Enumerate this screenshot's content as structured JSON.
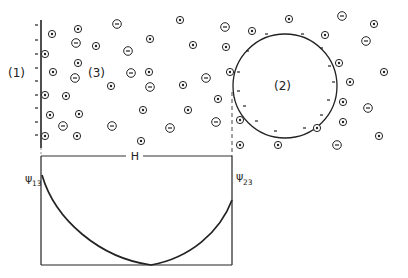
{
  "diagram": {
    "regions": {
      "surface1": "(1)",
      "medium3": "(3)",
      "particle2": "(2)"
    },
    "distance_label": "H",
    "potential_labels": {
      "left": {
        "symbol": "ψ",
        "sub": "13"
      },
      "right": {
        "symbol": "ψ",
        "sub": "23"
      }
    },
    "colors": {
      "ink": "#222222",
      "background": "#ffffff"
    },
    "ions": [
      {
        "x": 52,
        "y": 34,
        "sign": "+"
      },
      {
        "x": 78,
        "y": 29,
        "sign": "+"
      },
      {
        "x": 117,
        "y": 24,
        "sign": "-"
      },
      {
        "x": 76,
        "y": 43,
        "sign": "-"
      },
      {
        "x": 96,
        "y": 46,
        "sign": "+"
      },
      {
        "x": 128,
        "y": 51,
        "sign": "-"
      },
      {
        "x": 45,
        "y": 54,
        "sign": "+"
      },
      {
        "x": 78,
        "y": 63,
        "sign": "+"
      },
      {
        "x": 53,
        "y": 72,
        "sign": "+"
      },
      {
        "x": 75,
        "y": 78,
        "sign": "-"
      },
      {
        "x": 111,
        "y": 86,
        "sign": "+"
      },
      {
        "x": 45,
        "y": 95,
        "sign": "+"
      },
      {
        "x": 66,
        "y": 96,
        "sign": "+"
      },
      {
        "x": 50,
        "y": 115,
        "sign": "+"
      },
      {
        "x": 79,
        "y": 114,
        "sign": "+"
      },
      {
        "x": 63,
        "y": 126,
        "sign": "-"
      },
      {
        "x": 112,
        "y": 126,
        "sign": "-"
      },
      {
        "x": 45,
        "y": 136,
        "sign": "+"
      },
      {
        "x": 77,
        "y": 136,
        "sign": "+"
      },
      {
        "x": 180,
        "y": 20,
        "sign": "+"
      },
      {
        "x": 225,
        "y": 27,
        "sign": "-"
      },
      {
        "x": 252,
        "y": 31,
        "sign": "+"
      },
      {
        "x": 150,
        "y": 39,
        "sign": "+"
      },
      {
        "x": 193,
        "y": 45,
        "sign": "+"
      },
      {
        "x": 226,
        "y": 47,
        "sign": "+"
      },
      {
        "x": 149,
        "y": 72,
        "sign": "+"
      },
      {
        "x": 150,
        "y": 87,
        "sign": "-"
      },
      {
        "x": 183,
        "y": 85,
        "sign": "+"
      },
      {
        "x": 206,
        "y": 78,
        "sign": "-"
      },
      {
        "x": 218,
        "y": 99,
        "sign": "+"
      },
      {
        "x": 143,
        "y": 110,
        "sign": "+"
      },
      {
        "x": 188,
        "y": 110,
        "sign": "+"
      },
      {
        "x": 216,
        "y": 122,
        "sign": "-"
      },
      {
        "x": 240,
        "y": 120,
        "sign": "+"
      },
      {
        "x": 170,
        "y": 128,
        "sign": "-"
      },
      {
        "x": 141,
        "y": 141,
        "sign": "+"
      },
      {
        "x": 240,
        "y": 145,
        "sign": "+"
      },
      {
        "x": 131,
        "y": 73,
        "sign": "-"
      },
      {
        "x": 230,
        "y": 72,
        "sign": "+"
      },
      {
        "x": 289,
        "y": 19,
        "sign": "+"
      },
      {
        "x": 342,
        "y": 16,
        "sign": "-"
      },
      {
        "x": 374,
        "y": 24,
        "sign": "+"
      },
      {
        "x": 325,
        "y": 35,
        "sign": "+"
      },
      {
        "x": 366,
        "y": 41,
        "sign": "-"
      },
      {
        "x": 339,
        "y": 63,
        "sign": "+"
      },
      {
        "x": 384,
        "y": 72,
        "sign": "+"
      },
      {
        "x": 350,
        "y": 82,
        "sign": "+"
      },
      {
        "x": 343,
        "y": 102,
        "sign": "+"
      },
      {
        "x": 368,
        "y": 108,
        "sign": "-"
      },
      {
        "x": 343,
        "y": 122,
        "sign": "+"
      },
      {
        "x": 317,
        "y": 128,
        "sign": "+"
      },
      {
        "x": 379,
        "y": 136,
        "sign": "+"
      },
      {
        "x": 278,
        "y": 145,
        "sign": "+"
      },
      {
        "x": 337,
        "y": 145,
        "sign": "-"
      }
    ]
  }
}
